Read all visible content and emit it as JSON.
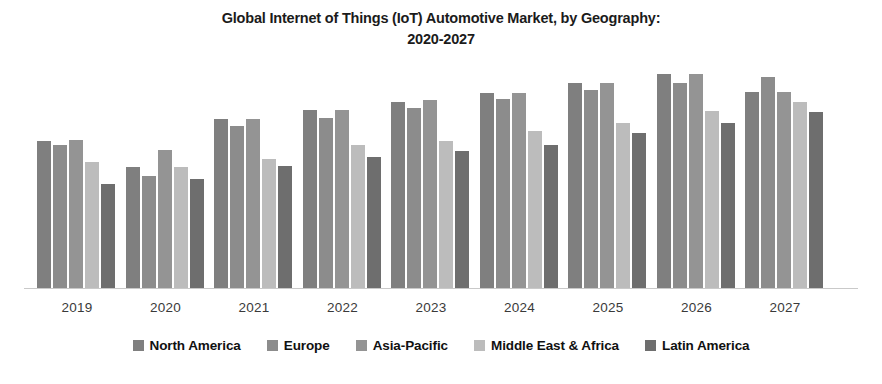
{
  "chart_data": {
    "type": "bar",
    "title": "Global Internet of Things (IoT) Automotive Market, by Geography: 2020-2027",
    "title_line1": "Global Internet of Things (IoT) Automotive Market, by Geography:",
    "title_line2": "2020-2027",
    "xlabel": "",
    "ylabel": "",
    "grid": false,
    "legend_position": "bottom",
    "ylim": [
      0,
      240
    ],
    "categories": [
      "2019",
      "2020",
      "2021",
      "2022",
      "2023",
      "2024",
      "2025",
      "2026",
      "2027"
    ],
    "series": [
      {
        "name": "North America",
        "color": "#7f7f7f",
        "values": [
          152,
          125,
          175,
          184,
          192,
          202,
          212,
          221,
          203
        ]
      },
      {
        "name": "Europe",
        "color": "#8c8c8c",
        "values": [
          148,
          116,
          168,
          176,
          186,
          196,
          205,
          212,
          218
        ]
      },
      {
        "name": "Asia-Pacific",
        "color": "#949494",
        "values": [
          153,
          143,
          175,
          184,
          194,
          202,
          212,
          221,
          203
        ]
      },
      {
        "name": "Middle East & Africa",
        "color": "#bcbcbc",
        "values": [
          130,
          125,
          133,
          148,
          152,
          162,
          171,
          183,
          192
        ]
      },
      {
        "name": "Latin America",
        "color": "#6e6e6e",
        "values": [
          108,
          113,
          126,
          136,
          142,
          148,
          160,
          171,
          182
        ]
      }
    ]
  },
  "legend": {
    "items": [
      {
        "label": "North America",
        "color": "#7f7f7f"
      },
      {
        "label": "Europe",
        "color": "#8c8c8c"
      },
      {
        "label": "Asia-Pacific",
        "color": "#949494"
      },
      {
        "label": "Middle East & Africa",
        "color": "#bcbcbc"
      },
      {
        "label": "Latin America",
        "color": "#6e6e6e"
      }
    ]
  },
  "layout": {
    "baseline_color": "#c9c9c9",
    "background": "#ffffff"
  }
}
